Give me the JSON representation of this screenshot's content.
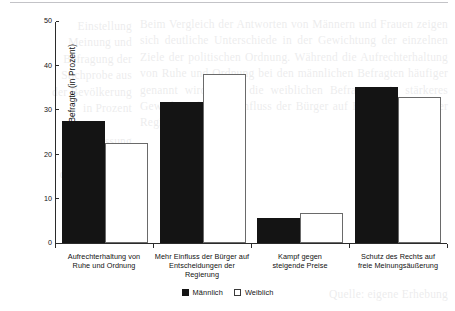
{
  "chart_data": {
    "type": "bar",
    "title": "",
    "subtitle": "",
    "xlabel": "",
    "ylabel": "Anteil der Befragte (in Prozent)",
    "ylim": [
      0,
      50
    ],
    "yticks": [
      0,
      10,
      20,
      30,
      40,
      50
    ],
    "ytick_labels": [
      "0",
      "10",
      "20",
      "30",
      "40",
      "50"
    ],
    "grid": false,
    "legend_position": "bottom-center",
    "categories": [
      "Aufrechterhaltung von Ruhe und Ordnung",
      "Mehr Einfluss der Bürger auf Entscheidungen der Regierung",
      "Kampf gegen steigende Preise",
      "Schutz des Rechts auf freie Meinungsäußerung"
    ],
    "category_lines": [
      [
        "Aufrechterhaltung von",
        "Ruhe und Ordnung"
      ],
      [
        "Mehr Einfluss der Bürger auf",
        "Entscheidungen der Regierung"
      ],
      [
        "Kampf gegen",
        "steigende Preise"
      ],
      [
        "Schutz des Rechts auf",
        "freie Meinungsäußerung"
      ]
    ],
    "series": [
      {
        "name": "Männlich",
        "color": "#141414",
        "values": [
          27.5,
          31.7,
          5.6,
          35.2
        ]
      },
      {
        "name": "Weiblich",
        "color": "#ffffff",
        "values": [
          22.5,
          38.0,
          6.7,
          32.9
        ]
      }
    ]
  },
  "legend": {
    "items": [
      {
        "label": "Männlich",
        "style": "male"
      },
      {
        "label": "Weiblich",
        "style": "female"
      }
    ]
  },
  "ghost_text": {
    "left_column": "Einstellung\nMeinung und\nBefragung der\nStichprobe aus\nder Bevölkerung\nin Prozent\n\nAuffassung\nüber die Rolle\nder Bürger und\nder staatlichen\nOrdnung im\nVergleich",
    "right_column": "Beim Vergleich der Antworten von Männern und Frauen zeigen sich deutliche Unterschiede in der Gewichtung der einzelnen Ziele der politischen Ordnung. Während die Aufrechterhaltung von Ruhe und Ordnung bei den männlichen Befragten häufiger genannt wird, legen die weiblichen Befragten ein stärkeres Gewicht auf mehr Einfluss der Bürger auf Entscheidungen der Regierung.",
    "bottom_column": "Quelle: eigene Erhebung"
  }
}
